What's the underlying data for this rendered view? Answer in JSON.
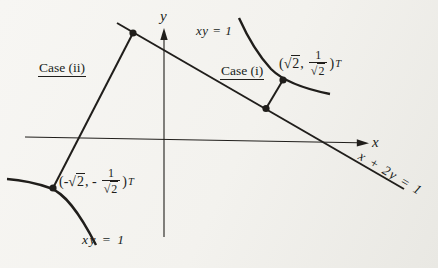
{
  "colors": {
    "background": "#f3f2ee",
    "ink": "#201e1b"
  },
  "axes": {
    "x_label": "x",
    "y_label": "y"
  },
  "equations": {
    "hyperbola_top": "xy = 1",
    "hyperbola_bottom": "xy = 1",
    "line": "x + 2y = 1"
  },
  "cases": {
    "case_i": "Case (i)",
    "case_ii": "Case (ii)"
  },
  "points": {
    "upper": {
      "open": "(",
      "sqrt_sign": "√",
      "sqrt_arg": "2",
      "sep": ",",
      "num": "1",
      "den_sqrt_sign": "√",
      "den_sqrt_arg": "2",
      "close": ")",
      "transpose": "T"
    },
    "lower": {
      "open": "(-",
      "sqrt_sign": "√",
      "sqrt_arg": "2",
      "sep": ", -",
      "num": "1",
      "den_sqrt_sign": "√",
      "den_sqrt_arg": "2",
      "close": ")",
      "transpose": "T"
    }
  }
}
